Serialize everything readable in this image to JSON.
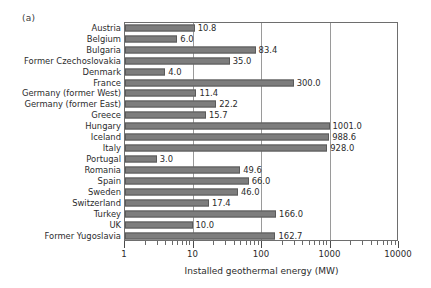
{
  "panel": {
    "label": "(a)"
  },
  "chart_data": {
    "type": "bar",
    "orientation": "horizontal",
    "title": "",
    "subtitle": "",
    "xlabel": "Installed geothermal energy (MW)",
    "ylabel": "",
    "xscale": "log",
    "xlim": [
      1,
      10000
    ],
    "xticks": [
      1,
      10,
      100,
      1000,
      10000
    ],
    "xticklabels": [
      "1",
      "10",
      "100",
      "1000",
      "10000"
    ],
    "grid": "vertical-major-only",
    "legend": null,
    "bar_color": "#7d7d7d",
    "bar_edge_color": "#5a5a5a",
    "categories": [
      "Austria",
      "Belgium",
      "Bulgaria",
      "Former Czechoslovakia",
      "Denmark",
      "France",
      "Germany (former West)",
      "Germany (former East)",
      "Greece",
      "Hungary",
      "Iceland",
      "Italy",
      "Portugal",
      "Romania",
      "Spain",
      "Sweden",
      "Switzerland",
      "Turkey",
      "UK",
      "Former Yugoslavia"
    ],
    "values": [
      10.8,
      6.0,
      83.4,
      35.0,
      4.0,
      300.0,
      11.4,
      22.2,
      15.7,
      1001.0,
      988.6,
      928.0,
      3.0,
      49.6,
      66.0,
      46.0,
      17.4,
      166.0,
      10.0,
      162.7
    ],
    "value_labels": [
      "10.8",
      "6.0",
      "83.4",
      "35.0",
      "4.0",
      "300.0",
      "11.4",
      "22.2",
      "15.7",
      "1001.0",
      "988.6",
      "928.0",
      "3.0",
      "49.6",
      "66.0",
      "46.0",
      "17.4",
      "166.0",
      "10.0",
      "162.7"
    ]
  }
}
